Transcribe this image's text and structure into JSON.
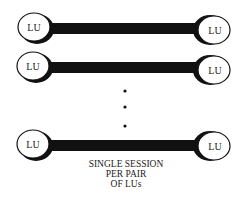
{
  "diagram": {
    "node_label": "LU",
    "pairs": [
      {
        "left": "LU",
        "right": "LU"
      },
      {
        "left": "LU",
        "right": "LU"
      },
      {
        "left": "LU",
        "right": "LU"
      }
    ],
    "ellipsis": "vertical dots",
    "caption": [
      "SINGLE SESSION",
      "PER PAIR",
      "OF LUs"
    ]
  },
  "colors": {
    "line": "#111111",
    "background": "#ffffff"
  }
}
